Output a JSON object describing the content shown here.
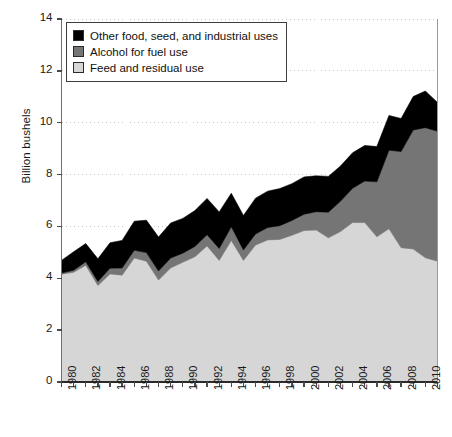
{
  "chart_data": {
    "type": "area",
    "title": "",
    "subtitle": "",
    "xlabel": "",
    "ylabel": "Billion bushels",
    "xlim": [
      1980,
      2011
    ],
    "ylim": [
      0,
      14
    ],
    "ytick_values": [
      0,
      2,
      4,
      6,
      8,
      10,
      12,
      14
    ],
    "ytick_labels": [
      "0",
      "2",
      "4",
      "6",
      "8",
      "10",
      "12",
      "14"
    ],
    "xtick_values": [
      1980,
      1982,
      1984,
      1986,
      1988,
      1990,
      1992,
      1994,
      1996,
      1998,
      2000,
      2002,
      2004,
      2006,
      2008,
      2010
    ],
    "xtick_labels": [
      "1980",
      "1982",
      "1984",
      "1986",
      "1988",
      "1990",
      "1992",
      "1994",
      "1996",
      "1998",
      "2000",
      "2002",
      "2004",
      "2006",
      "2008",
      "2010"
    ],
    "x": [
      1980,
      1981,
      1982,
      1983,
      1984,
      1985,
      1986,
      1987,
      1988,
      1989,
      1990,
      1991,
      1992,
      1993,
      1994,
      1995,
      1996,
      1997,
      1998,
      1999,
      2000,
      2001,
      2002,
      2003,
      2004,
      2005,
      2006,
      2007,
      2008,
      2009,
      2010,
      2011
    ],
    "stacked": true,
    "grid": "horizontal-dotted",
    "legend_position": "upper-left",
    "series": [
      {
        "name": "Feed and residual use",
        "color": "#d6d6d6",
        "values": [
          4.16,
          4.23,
          4.5,
          3.72,
          4.17,
          4.12,
          4.78,
          4.66,
          3.93,
          4.4,
          4.62,
          4.83,
          5.25,
          4.69,
          5.46,
          4.69,
          5.28,
          5.48,
          5.5,
          5.66,
          5.84,
          5.86,
          5.56,
          5.8,
          6.15,
          6.15,
          5.6,
          5.91,
          5.18,
          5.13,
          4.79,
          4.66
        ]
      },
      {
        "name": "Alcohol for fuel use",
        "color": "#757575",
        "values": [
          0.04,
          0.08,
          0.14,
          0.16,
          0.22,
          0.28,
          0.3,
          0.33,
          0.35,
          0.38,
          0.35,
          0.4,
          0.43,
          0.46,
          0.53,
          0.4,
          0.43,
          0.48,
          0.53,
          0.57,
          0.63,
          0.71,
          0.99,
          1.17,
          1.32,
          1.6,
          2.12,
          3.03,
          3.71,
          4.59,
          5.02,
          5.01
        ]
      },
      {
        "name": "Other food, seed, and industrial uses",
        "color": "#000000",
        "values": [
          0.49,
          0.71,
          0.7,
          0.87,
          0.98,
          1.06,
          1.12,
          1.25,
          1.31,
          1.35,
          1.34,
          1.38,
          1.4,
          1.41,
          1.29,
          1.33,
          1.38,
          1.4,
          1.43,
          1.42,
          1.44,
          1.38,
          1.38,
          1.36,
          1.37,
          1.37,
          1.36,
          1.34,
          1.27,
          1.29,
          1.41,
          1.11
        ]
      }
    ],
    "totals": [
      4.69,
      5.02,
      5.34,
      4.75,
      5.37,
      5.46,
      6.2,
      6.24,
      5.59,
      6.13,
      6.31,
      6.61,
      7.08,
      6.56,
      7.28,
      6.42,
      7.09,
      7.36,
      7.46,
      7.65,
      7.91,
      7.95,
      7.93,
      8.33,
      8.84,
      9.12,
      9.08,
      10.28,
      10.16,
      11.01,
      11.22,
      10.78
    ]
  },
  "axes": {
    "y_axis_label": "Billion bushels"
  },
  "legend": {
    "items": [
      {
        "label": "Other food, seed, and industrial uses",
        "swatch": "#000000"
      },
      {
        "label": "Alcohol for fuel use",
        "swatch": "#757575"
      },
      {
        "label": "Feed and residual use",
        "swatch": "#d6d6d6"
      }
    ]
  },
  "footnote": {
    "text": ""
  }
}
